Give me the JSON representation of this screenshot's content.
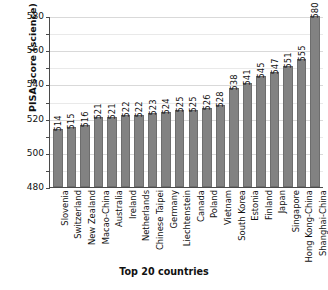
{
  "chart_data": {
    "type": "bar",
    "title": "",
    "xlabel": "Top 20 countries",
    "ylabel": "PISA score (science)",
    "ylim": [
      480,
      580
    ],
    "yticks": [
      480,
      500,
      520,
      540,
      560,
      580
    ],
    "minor_tick_interval": 10,
    "grid": true,
    "legend": "none",
    "orientation": "vertical",
    "bar_color": "#828282",
    "categories": [
      "Slovenia",
      "Switzerland",
      "New Zealand",
      "Macao-China",
      "Australia",
      "Ireland",
      "Netherlands",
      "Chinese Taipei",
      "Germany",
      "Liechtenstein",
      "Canada",
      "Poland",
      "Vietnam",
      "South Korea",
      "Estonia",
      "Finland",
      "Japan",
      "Singapore",
      "Hong Kong-China",
      "Shanghai-China"
    ],
    "values": [
      514,
      515,
      516,
      521,
      521,
      522,
      522,
      523,
      524,
      525,
      525,
      526,
      528,
      538,
      541,
      545,
      547,
      551,
      555,
      580
    ],
    "value_labels": [
      "514",
      "515",
      "516",
      "521",
      "521",
      "522",
      "522",
      "523",
      "524",
      "525",
      "525",
      "526",
      "528",
      "538",
      "541",
      "545",
      "547",
      "551",
      "555",
      "580"
    ]
  }
}
